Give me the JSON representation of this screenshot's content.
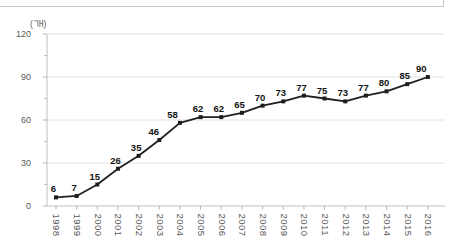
{
  "chart_data": {
    "type": "line",
    "title": "",
    "unit_label": "(개)",
    "xlabel": "",
    "ylabel": "(개)",
    "categories": [
      "1998",
      "1999",
      "2000",
      "2001",
      "2002",
      "2003",
      "2004",
      "2005",
      "2006",
      "2007",
      "2008",
      "2009",
      "2010",
      "2011",
      "2012",
      "2013",
      "2014",
      "2015",
      "2016"
    ],
    "series": [
      {
        "name": "count",
        "values": [
          6,
          7,
          15,
          26,
          35,
          46,
          58,
          62,
          62,
          65,
          70,
          73,
          77,
          75,
          73,
          77,
          80,
          85,
          90
        ]
      }
    ],
    "data_labels_shown": true,
    "ylim": [
      0,
      120
    ],
    "yticks": [
      0,
      30,
      60,
      90,
      120
    ],
    "y_minor_tick_interval": 15,
    "grid": "horizontal",
    "legend": "none",
    "marker": "square",
    "label_rotation_x": 90,
    "colors": {
      "series_line": "#1f1f1f",
      "marker": "#1f1f1f",
      "value_label": "#141414",
      "axis_line": "#bfbfbf",
      "tick_mark": "#b5b5b5",
      "gridline": "#e2e2e2",
      "tick_label": "#595959",
      "panel_edge": "#c6c6c6",
      "background": "#ffffff"
    }
  }
}
